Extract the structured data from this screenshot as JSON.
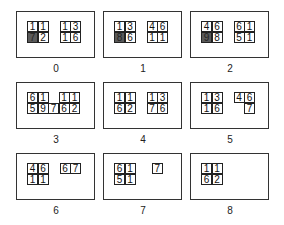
{
  "panels": [
    {
      "label": "0",
      "x": 16,
      "y": 11,
      "cells": [
        {
          "c": 0,
          "r": 0,
          "v": "1"
        },
        {
          "c": 1,
          "r": 0,
          "v": "1"
        },
        {
          "c": 0,
          "r": 1,
          "v": "7",
          "shaded": true
        },
        {
          "c": 1,
          "r": 1,
          "v": "2"
        },
        {
          "c": 3.1,
          "r": 0,
          "v": "1"
        },
        {
          "c": 4.1,
          "r": 0,
          "v": "3"
        },
        {
          "c": 3.1,
          "r": 1,
          "v": "1"
        },
        {
          "c": 4.1,
          "r": 1,
          "v": "6"
        }
      ]
    },
    {
      "label": "1",
      "x": 103,
      "y": 11,
      "cells": [
        {
          "c": 0,
          "r": 0,
          "v": "1"
        },
        {
          "c": 1,
          "r": 0,
          "v": "3"
        },
        {
          "c": 0,
          "r": 1,
          "v": "8",
          "shaded": true
        },
        {
          "c": 1,
          "r": 1,
          "v": "6"
        },
        {
          "c": 3.1,
          "r": 0,
          "v": "4"
        },
        {
          "c": 4.1,
          "r": 0,
          "v": "6"
        },
        {
          "c": 3.1,
          "r": 1,
          "v": "1"
        },
        {
          "c": 4.1,
          "r": 1,
          "v": "1"
        }
      ]
    },
    {
      "label": "2",
      "x": 190,
      "y": 11,
      "cells": [
        {
          "c": 0,
          "r": 0,
          "v": "4"
        },
        {
          "c": 1,
          "r": 0,
          "v": "6"
        },
        {
          "c": 0,
          "r": 1,
          "v": "9",
          "shaded": true
        },
        {
          "c": 1,
          "r": 1,
          "v": "8"
        },
        {
          "c": 3.1,
          "r": 0,
          "v": "6"
        },
        {
          "c": 4.1,
          "r": 0,
          "v": "1"
        },
        {
          "c": 3.1,
          "r": 1,
          "v": "5"
        },
        {
          "c": 4.1,
          "r": 1,
          "v": "1"
        }
      ]
    },
    {
      "label": "3",
      "x": 16,
      "y": 82,
      "cells": [
        {
          "c": 0,
          "r": 0,
          "v": "6"
        },
        {
          "c": 1,
          "r": 0,
          "v": "1"
        },
        {
          "c": 3,
          "r": 0,
          "v": "1"
        },
        {
          "c": 4,
          "r": 0,
          "v": "1"
        },
        {
          "c": 0,
          "r": 1,
          "v": "5"
        },
        {
          "c": 1,
          "r": 1,
          "v": "9"
        },
        {
          "c": 2,
          "r": 1,
          "v": "7"
        },
        {
          "c": 3,
          "r": 1,
          "v": "6"
        },
        {
          "c": 4,
          "r": 1,
          "v": "2"
        }
      ]
    },
    {
      "label": "4",
      "x": 103,
      "y": 82,
      "cells": [
        {
          "c": 0,
          "r": 0,
          "v": "1"
        },
        {
          "c": 1,
          "r": 0,
          "v": "1"
        },
        {
          "c": 0,
          "r": 1,
          "v": "6"
        },
        {
          "c": 1,
          "r": 1,
          "v": "2"
        },
        {
          "c": 3.1,
          "r": 0,
          "v": "1"
        },
        {
          "c": 4.1,
          "r": 0,
          "v": "3"
        },
        {
          "c": 3.1,
          "r": 1,
          "v": "7"
        },
        {
          "c": 4.1,
          "r": 1,
          "v": "6"
        }
      ]
    },
    {
      "label": "5",
      "x": 190,
      "y": 82,
      "cells": [
        {
          "c": 0,
          "r": 0,
          "v": "1"
        },
        {
          "c": 1,
          "r": 0,
          "v": "3"
        },
        {
          "c": 0,
          "r": 1,
          "v": "1"
        },
        {
          "c": 1,
          "r": 1,
          "v": "6"
        },
        {
          "c": 3.1,
          "r": 0,
          "v": "4"
        },
        {
          "c": 4.1,
          "r": 0,
          "v": "6"
        },
        {
          "c": 4.1,
          "r": 1,
          "v": "7"
        }
      ]
    },
    {
      "label": "6",
      "x": 16,
      "y": 153,
      "cells": [
        {
          "c": 0,
          "r": 0,
          "v": "4"
        },
        {
          "c": 1,
          "r": 0,
          "v": "6"
        },
        {
          "c": 0,
          "r": 1,
          "v": "1"
        },
        {
          "c": 1,
          "r": 1,
          "v": "1"
        },
        {
          "c": 3.1,
          "r": 0,
          "v": "6"
        },
        {
          "c": 4.1,
          "r": 0,
          "v": "7"
        }
      ]
    },
    {
      "label": "7",
      "x": 103,
      "y": 153,
      "cells": [
        {
          "c": 0,
          "r": 0,
          "v": "6"
        },
        {
          "c": 1,
          "r": 0,
          "v": "1"
        },
        {
          "c": 0,
          "r": 1,
          "v": "5"
        },
        {
          "c": 1,
          "r": 1,
          "v": "1"
        },
        {
          "c": 3.6,
          "r": 0,
          "v": "7"
        }
      ]
    },
    {
      "label": "8",
      "x": 190,
      "y": 153,
      "cells": [
        {
          "c": 0,
          "r": 0,
          "v": "1"
        },
        {
          "c": 1,
          "r": 0,
          "v": "1"
        },
        {
          "c": 0,
          "r": 1,
          "v": "6"
        },
        {
          "c": 1,
          "r": 1,
          "v": "2"
        }
      ]
    }
  ]
}
